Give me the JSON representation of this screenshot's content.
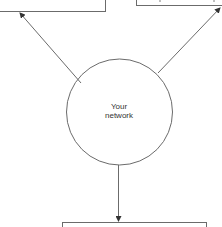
{
  "diagram": {
    "type": "network-flow",
    "nodes": [
      {
        "id": "left-box",
        "shape": "rectangle",
        "label": "",
        "note": "cropped at top edge"
      },
      {
        "id": "right-box",
        "shape": "rectangle",
        "label": "",
        "note": "cropped at top edge; only text descenders visible"
      },
      {
        "id": "your-network",
        "shape": "circle",
        "label_lines": [
          "Your",
          "network"
        ]
      },
      {
        "id": "bottom-box",
        "shape": "rectangle",
        "label": "",
        "note": "cropped at bottom edge"
      }
    ],
    "edges": [
      {
        "from": "your-network",
        "to": "left-box",
        "arrow": "end"
      },
      {
        "from": "your-network",
        "to": "right-box",
        "arrow": "end"
      },
      {
        "from": "your-network",
        "to": "bottom-box",
        "arrow": "end"
      }
    ],
    "colors": {
      "stroke": "#6b6b6b",
      "text": "#333333",
      "background": "#ffffff"
    }
  },
  "circle": {
    "line1": "Your",
    "line2": "network"
  }
}
